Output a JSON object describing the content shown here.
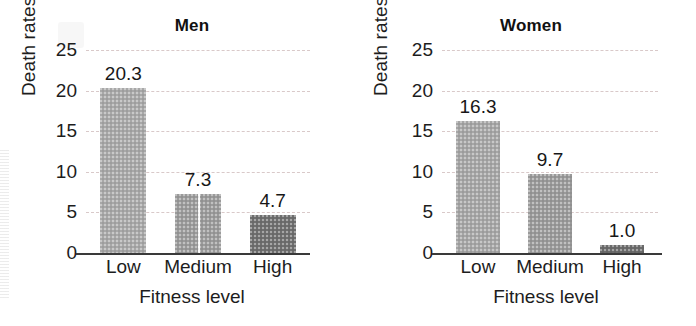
{
  "chart_data": [
    {
      "type": "bar",
      "title": "Men",
      "xlabel": "Fitness level",
      "ylabel": "Death rates*",
      "categories": [
        "Low",
        "Medium",
        "High"
      ],
      "values": [
        20.3,
        7.3,
        4.7
      ],
      "value_labels": [
        "20.3",
        "7.3",
        "4.7"
      ],
      "ylim": [
        0,
        25
      ],
      "yticks": [
        0,
        5,
        10,
        15,
        20,
        25
      ],
      "ytick_labels": [
        "0",
        "5",
        "10",
        "15",
        "20",
        "25"
      ],
      "grid": true,
      "grid_style": "dashed",
      "grid_color": "#d9c9c9",
      "legend": "none",
      "bar_colors": [
        "#a8a8a8",
        "#9b9b9b",
        "#6f6f6f"
      ]
    },
    {
      "type": "bar",
      "title": "Women",
      "xlabel": "Fitness level",
      "ylabel": "Death rates*",
      "categories": [
        "Low",
        "Medium",
        "High"
      ],
      "values": [
        16.3,
        9.7,
        1.0
      ],
      "value_labels": [
        "16.3",
        "9.7",
        "1.0"
      ],
      "ylim": [
        0,
        25
      ],
      "yticks": [
        0,
        5,
        10,
        15,
        20,
        25
      ],
      "ytick_labels": [
        "0",
        "5",
        "10",
        "15",
        "20",
        "25"
      ],
      "grid": true,
      "grid_style": "dashed",
      "grid_color": "#d9c9c9",
      "legend": "none",
      "bar_colors": [
        "#a6a6a6",
        "#9a9a9a",
        "#6c6c6c"
      ]
    }
  ],
  "panels": [
    {
      "id": "men",
      "title": "Men",
      "ylabel": "Death rates*",
      "xtitle": "Fitness level",
      "yticks": [
        "25",
        "20",
        "15",
        "10",
        "5",
        "0"
      ],
      "bars": [
        {
          "category": "Low",
          "value": 20.3,
          "label": "20.3",
          "color": "#a8a8a8",
          "seam": false
        },
        {
          "category": "Medium",
          "value": 7.3,
          "label": "7.3",
          "color": "#9b9b9b",
          "seam": true
        },
        {
          "category": "High",
          "value": 4.7,
          "label": "4.7",
          "color": "#6f6f6f",
          "seam": false
        }
      ]
    },
    {
      "id": "women",
      "title": "Women",
      "ylabel": "Death rates*",
      "xtitle": "Fitness level",
      "yticks": [
        "25",
        "20",
        "15",
        "10",
        "5",
        "0"
      ],
      "bars": [
        {
          "category": "Low",
          "value": 16.3,
          "label": "16.3",
          "color": "#a6a6a6",
          "seam": false
        },
        {
          "category": "Medium",
          "value": 9.7,
          "label": "9.7",
          "color": "#9a9a9a",
          "seam": false
        },
        {
          "category": "High",
          "value": 1.0,
          "label": "1.0",
          "color": "#6c6c6c",
          "seam": false
        }
      ]
    }
  ]
}
